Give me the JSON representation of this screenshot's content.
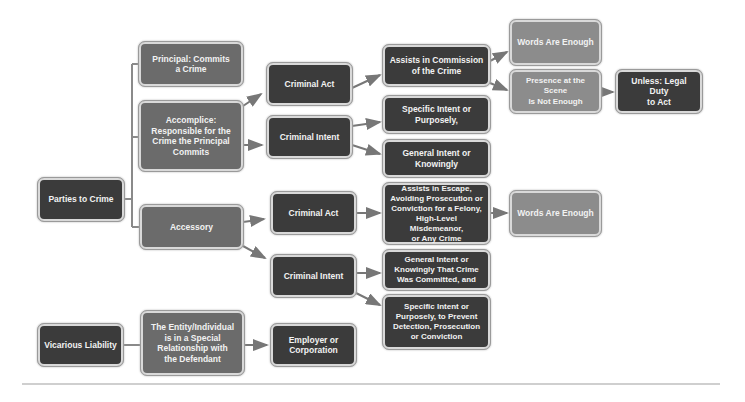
{
  "diagram": {
    "nodes": {
      "parties": "Parties to Crime",
      "principal": "Principal: Commits\na Crime",
      "accomplice": "Accomplice:\nResponsible for the\nCrime the Principal\nCommits",
      "accessory": "Accessory",
      "act1": "Criminal Act",
      "intent1": "Criminal Intent",
      "assists_commission": "Assists in Commission\nof the Crime",
      "specific1": "Specific Intent or\nPurposely,",
      "general1": "General Intent or\nKnowingly",
      "words1": "Words Are Enough",
      "presence": "Presence at the Scene\nIs Not Enough",
      "unless": "Unless: Legal Duty\nto Act",
      "act2": "Criminal Act",
      "intent2": "Criminal Intent",
      "assists_escape": "Assists in Escape,\nAvoiding Prosecution or\nConviction for a Felony,\nHigh-Level Misdemeanor,\nor Any Crime",
      "words2": "Words Are Enough",
      "general2": "General Intent or\nKnowingly That Crime\nWas Committed, and",
      "specific2": "Specific Intent or\nPurposely, to Prevent\nDetection, Prosecution\nor Conviction",
      "vicarious": "Vicarious Liability",
      "entity": "The Entity/Individual\nis in a Special\nRelationship with\nthe Defendant",
      "employer": "Employer or\nCorporation"
    },
    "colors": {
      "dark": "#3b3b3b",
      "mid": "#6b6b6b",
      "light": "#8c8c8c",
      "connector": "#777777"
    }
  }
}
